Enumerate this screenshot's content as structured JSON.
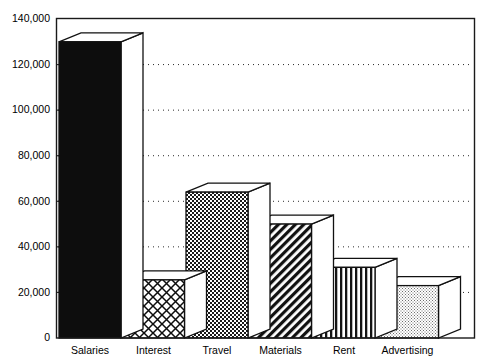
{
  "chart_data": {
    "type": "bar",
    "title": "",
    "subtitle": "",
    "xlabel": "",
    "ylabel": "",
    "categories": [
      "Salaries",
      "Interest",
      "Travel",
      "Materials",
      "Rent",
      "Advertising"
    ],
    "values": [
      130000,
      25500,
      64000,
      50000,
      31000,
      23000
    ],
    "series": [
      {
        "name": "Expenses",
        "values": [
          130000,
          25500,
          64000,
          50000,
          31000,
          23000
        ]
      }
    ],
    "ylim": [
      0,
      140000
    ],
    "ytick_values": [
      0,
      20000,
      40000,
      60000,
      80000,
      100000,
      120000,
      140000
    ],
    "ytick_labels": [
      "0",
      "20,000",
      "40,000",
      "60,000",
      "80,000",
      "100,000",
      "120,000",
      "140,000"
    ],
    "grid": "horizontal-dotted",
    "legend": "none",
    "style": "3d-bars-monochrome-hatched",
    "bar_patterns": [
      "solid-black",
      "diamond-crosshatch",
      "checkerboard-dots",
      "diagonal-stripes",
      "vertical-stripes",
      "light-dots"
    ],
    "annotations": []
  },
  "axes": {
    "y_axis_name": "value-axis",
    "x_axis_name": "category-axis"
  }
}
